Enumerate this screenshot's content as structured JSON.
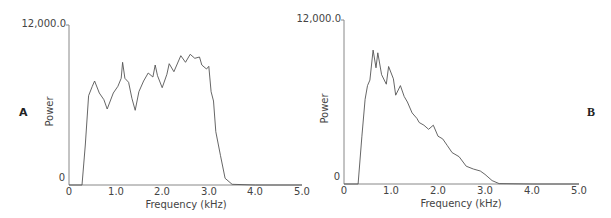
{
  "chart_data": [
    {
      "type": "line",
      "panel": "A",
      "title": "",
      "xlabel": "Frequency (kHz)",
      "ylabel": "Power",
      "xlim": [
        0,
        5.0
      ],
      "ylim": [
        0,
        12000.0
      ],
      "x_ticks": [
        "0",
        "1.0",
        "2.0",
        "3.0",
        "4.0",
        "5.0"
      ],
      "y_ticks": [
        "0",
        "12,000.0"
      ],
      "grid": false,
      "legend": null,
      "series": [
        {
          "name": "Spectrum A",
          "x": [
            0,
            0.28,
            0.35,
            0.42,
            0.5,
            0.55,
            0.65,
            0.75,
            0.82,
            0.95,
            1.05,
            1.12,
            1.15,
            1.2,
            1.28,
            1.35,
            1.42,
            1.5,
            1.6,
            1.7,
            1.8,
            1.85,
            1.9,
            2.0,
            2.1,
            2.15,
            2.25,
            2.35,
            2.4,
            2.5,
            2.6,
            2.7,
            2.8,
            2.85,
            2.95,
            3.0,
            3.05,
            3.1,
            3.15,
            3.25,
            3.35,
            3.5,
            4.0,
            5.0
          ],
          "y": [
            0,
            0,
            3000,
            6700,
            7400,
            7800,
            6900,
            6400,
            5700,
            6900,
            7400,
            8000,
            9200,
            8000,
            7700,
            6500,
            5600,
            7000,
            7800,
            8400,
            8100,
            9000,
            8200,
            7300,
            8300,
            9100,
            8500,
            9300,
            9700,
            9200,
            9800,
            9500,
            9600,
            9000,
            8700,
            8900,
            7000,
            6300,
            4000,
            2200,
            500,
            50,
            0,
            0
          ]
        }
      ]
    },
    {
      "type": "line",
      "panel": "B",
      "title": "",
      "xlabel": "Frequency (kHz)",
      "ylabel": "Power",
      "xlim": [
        0,
        5.0
      ],
      "ylim": [
        0,
        12000.0
      ],
      "x_ticks": [
        "0",
        "1.0",
        "2.0",
        "3.0",
        "4.0",
        "5.0"
      ],
      "y_ticks": [
        "0",
        "12,000.0"
      ],
      "grid": false,
      "legend": null,
      "series": [
        {
          "name": "Spectrum B",
          "x": [
            0,
            0.3,
            0.38,
            0.45,
            0.5,
            0.55,
            0.62,
            0.68,
            0.72,
            0.8,
            0.9,
            0.95,
            1.05,
            1.1,
            1.2,
            1.28,
            1.35,
            1.45,
            1.55,
            1.6,
            1.7,
            1.8,
            1.9,
            2.0,
            2.1,
            2.2,
            2.3,
            2.45,
            2.6,
            2.75,
            2.9,
            3.0,
            3.15,
            3.3,
            4.0,
            5.0
          ],
          "y": [
            0,
            0,
            3500,
            6200,
            7200,
            7600,
            9800,
            8500,
            9600,
            8000,
            7300,
            8600,
            7700,
            6500,
            7200,
            6400,
            6000,
            5200,
            4800,
            4500,
            4300,
            4000,
            4300,
            3500,
            3300,
            2800,
            2300,
            2000,
            1300,
            1100,
            950,
            700,
            250,
            30,
            0,
            0
          ]
        }
      ]
    }
  ],
  "panels": [
    {
      "letter": "A",
      "ylabel": "Power",
      "xlabel": "Frequency (kHz)",
      "y_top": "12,000.0",
      "y_bottom": "0",
      "x_ticks": [
        "0",
        "1.0",
        "2.0",
        "3.0",
        "4.0",
        "5.0"
      ]
    },
    {
      "letter": "B",
      "ylabel": "Power",
      "xlabel": "Frequency (kHz)",
      "y_top": "12,000.0",
      "y_bottom": "0",
      "x_ticks": [
        "0",
        "1.0",
        "2.0",
        "3.0",
        "4.0",
        "5.0"
      ]
    }
  ],
  "colors": {
    "line": "#555555",
    "axis": "#888888",
    "text": "#444444"
  }
}
